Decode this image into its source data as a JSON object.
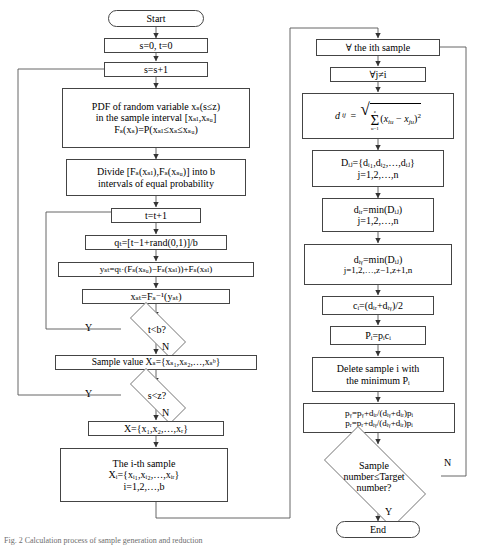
{
  "figure": {
    "type": "flowchart",
    "caption": "Fig. 2 Calculation process of sample generation and reduction"
  },
  "left_column": {
    "start": "Start",
    "init": "s=0, t=0",
    "s_increment": "s=s+1",
    "pdf": {
      "line1": "PDF of random variable xₛ(s≤z)",
      "line2": "in the sample interval [xₛₗ,xₛᵤ]",
      "line3": "Fₛ(xₛ)=P(xₛₗ≤xₛ≤xₛᵤ)"
    },
    "divide": {
      "line1": "Divide [Fₛ(xₛₗ),Fₛ(xₛᵤ)] into b",
      "line2": "intervals of equal probability"
    },
    "t_increment": "t=t+1",
    "q_t": "qₜ=[t−1+rand(0,1)]/b",
    "y_st": "yₛₜ=qₜ·(Fₛ(xₛᵤ)−Fₛ(xₛₗ))+Fₛ(xₛₗ)",
    "x_st": "xₛₜ=Fₛ⁻¹(yₛₜ)",
    "decision_t": "t<b?",
    "sample_value": "Sample value Xₛ={xₛ₁,xₛ₂,…,xₛᵇ}",
    "decision_s": "s<z?",
    "X_set": "X={x₁,x₂,…,xᵣ}",
    "ith_sample": {
      "line1": "The i-th sample",
      "line2": "Xᵢ={xᵢ₁,xᵢ₂,…,xᵢᵣ}",
      "line3": "i=1,2,…,b"
    }
  },
  "right_column": {
    "forall_sample": "∀  the ith sample",
    "forall_j": "∀j≠i",
    "distance": "dᵢⱼ = √(Σ ᵤ₌₁ᶠ (xᵢᵤ − xⱼᵤ)²)",
    "distance_parts": {
      "lhs": "d",
      "lhs_sub": "ij",
      "eq": "=",
      "sum_upper": "z",
      "sum_lower": "u=1",
      "body_open": "(x",
      "body_sub1": "iu",
      "minus": "− x",
      "body_sub2": "ju",
      "body_close": ")",
      "power": "2"
    },
    "D_ij": {
      "line1": "Dᵢⱼ={dᵢ₁,dᵢ₂,…,dᵢⱼ}",
      "line2": "j=1,2,…,n"
    },
    "d_iz": {
      "line1": "dᵢᵣ=min(Dᵢⱼ)",
      "line2": "j=1,2,…,n"
    },
    "d_iy": {
      "line1": "dᵢᵧ=min(Dᵢⱼ)",
      "line2": "j=1,2,…,z−1,z+1,n"
    },
    "c_i": "cᵢ=(dᵢᵣ+dᵢᵧ)/2",
    "P_i": "Pᵢ=pᵢcᵢ",
    "delete": {
      "line1": "Delete sample i with",
      "line2": "the minimum Pᵢ"
    },
    "p_update": {
      "line1": "pᵧ=pᵧ+dᵢᵣ/(dᵢᵧ+dᵢᵣ)pᵢ",
      "line2": "pᵣ=pᵣ+dᵢᵧ/(dᵢᵧ+dᵢᵣ)pᵢ"
    },
    "decision_sample": {
      "line1": "Sample",
      "line2": "number≤Target",
      "line3": "number?"
    },
    "end": "End"
  },
  "branch_labels": {
    "t_yes": "Y",
    "t_no": "N",
    "s_yes": "Y",
    "s_no": "N",
    "sample_no": "N",
    "sample_yes": "Y"
  },
  "colors": {
    "stroke": "#444444",
    "text": "#000000",
    "background": "#ffffff",
    "caption": "#6d6d6d"
  }
}
